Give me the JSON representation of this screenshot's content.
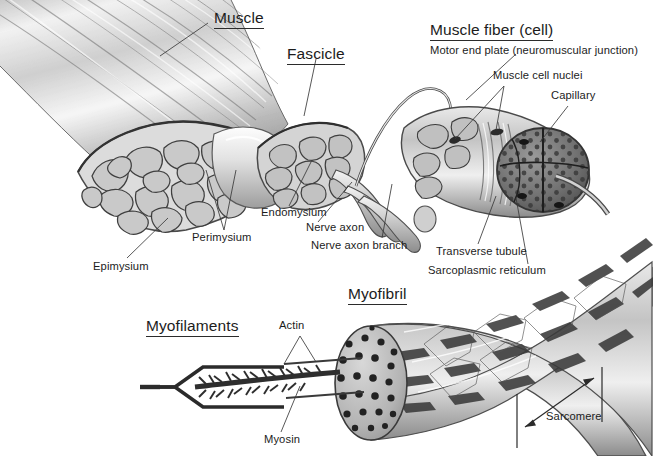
{
  "figure": {
    "background_color": "#ffffff",
    "ink_color": "#1c1c1c",
    "style": "grayscale pencil anatomical illustration"
  },
  "major_labels": [
    {
      "id": "muscle",
      "text": "Muscle"
    },
    {
      "id": "fascicle",
      "text": "Fascicle"
    },
    {
      "id": "muscle-fiber",
      "text": "Muscle fiber (cell)"
    },
    {
      "id": "myofibril",
      "text": "Myofibril"
    },
    {
      "id": "myofilaments",
      "text": "Myofilaments"
    }
  ],
  "callout_labels": [
    {
      "id": "motor-end-plate",
      "text": "Motor end plate (neuromuscular junction)"
    },
    {
      "id": "muscle-cell-nuclei",
      "text": "Muscle cell nuclei"
    },
    {
      "id": "capillary",
      "text": "Capillary"
    },
    {
      "id": "endomysium",
      "text": "Endomysium"
    },
    {
      "id": "perimysium",
      "text": "Perimysium"
    },
    {
      "id": "epimysium",
      "text": "Epimysium"
    },
    {
      "id": "nerve-axon",
      "text": "Nerve axon"
    },
    {
      "id": "nerve-axon-branch",
      "text": "Nerve axon branch"
    },
    {
      "id": "transverse-tubule",
      "text": "Transverse tubule"
    },
    {
      "id": "sarcoplasmic-reticulum",
      "text": "Sarcoplasmic reticulum"
    },
    {
      "id": "actin",
      "text": "Actin"
    },
    {
      "id": "myosin",
      "text": "Myosin"
    },
    {
      "id": "sarcomere",
      "text": "Sarcomere"
    }
  ],
  "caption": {
    "text": "",
    "note": "caption clipped by bottom edge of image"
  }
}
